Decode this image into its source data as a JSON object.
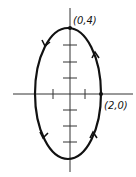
{
  "diagram": {
    "type": "ellipse-path",
    "equation_implied": "x^2/4 + y^2/16 = 1",
    "orientation": "counterclockwise",
    "points": [
      {
        "label": "(0,4)",
        "x": 0,
        "y": 4
      },
      {
        "label": "(2,0)",
        "x": 2,
        "y": 0
      }
    ],
    "semi_axes": {
      "a": 2,
      "b": 4
    },
    "ticks": {
      "x": [
        -1,
        1
      ],
      "y": [
        -3,
        -2,
        -1,
        1,
        2,
        3
      ]
    },
    "colors": {
      "stroke": "#111111",
      "background": "#ffffff"
    }
  }
}
